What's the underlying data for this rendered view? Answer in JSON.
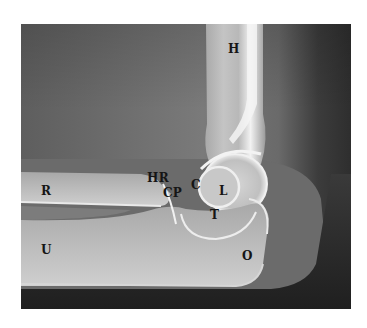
{
  "image": {
    "description": "Lateral radiograph of the elbow with anatomical labels",
    "background": "#ffffff",
    "labels": [
      {
        "id": "H",
        "text": "H",
        "x": 228,
        "y": 43
      },
      {
        "id": "HR",
        "text": "HR",
        "x": 147,
        "y": 172
      },
      {
        "id": "CP",
        "text": "CP",
        "x": 163,
        "y": 187
      },
      {
        "id": "C",
        "text": "C",
        "x": 191,
        "y": 179
      },
      {
        "id": "L",
        "text": "L",
        "x": 219,
        "y": 185
      },
      {
        "id": "T",
        "text": "T",
        "x": 210,
        "y": 209
      },
      {
        "id": "R",
        "text": "R",
        "x": 41,
        "y": 185
      },
      {
        "id": "U",
        "text": "U",
        "x": 41,
        "y": 244
      },
      {
        "id": "O",
        "text": "O",
        "x": 242,
        "y": 250
      }
    ]
  }
}
